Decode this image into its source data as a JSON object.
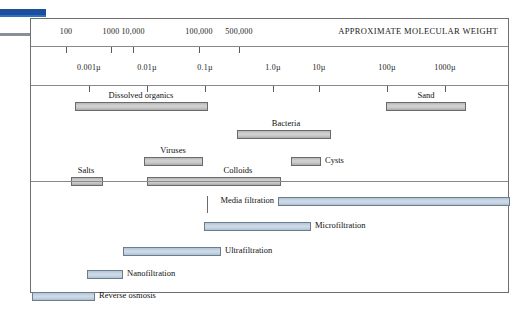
{
  "header": {
    "title": "APPROXIMATE MOLECULAR WEIGHT"
  },
  "chart_data": {
    "type": "bar",
    "title": "APPROXIMATE MOLECULAR WEIGHT",
    "subtitle": "Particle size / filtration spectrum",
    "xlabel": "Particle size (micrometers) / Approximate molecular weight",
    "ylabel": "",
    "grid": false,
    "legend": "none",
    "axes": [
      {
        "name": "molecular_weight",
        "position": "top",
        "ticks": [
          {
            "label": "100",
            "x": 65
          },
          {
            "label": "1000",
            "x": 110
          },
          {
            "label": "10,000",
            "x": 132
          },
          {
            "label": "100,000",
            "x": 198
          },
          {
            "label": "500,000",
            "x": 238
          }
        ]
      },
      {
        "name": "particle_size_microns",
        "position": "top",
        "ticks": [
          {
            "label": "0.001µ",
            "x": 88
          },
          {
            "label": "0.01µ",
            "x": 146
          },
          {
            "label": "0.1µ",
            "x": 204
          },
          {
            "label": "1.0µ",
            "x": 272
          },
          {
            "label": "10µ",
            "x": 318
          },
          {
            "label": "100µ",
            "x": 386
          },
          {
            "label": "1000µ",
            "x": 444
          }
        ]
      }
    ],
    "series": [
      {
        "name": "Particles and constituents",
        "color": "#c8c8c8",
        "bars": [
          {
            "label": "Dissolved organics",
            "x0": 74,
            "x1": 207,
            "row": 0,
            "label_x": 140,
            "label_pos": "above-center"
          },
          {
            "label": "Sand",
            "x0": 385,
            "x1": 465,
            "row": 0,
            "label_x": 425,
            "label_pos": "above-center"
          },
          {
            "label": "Bacteria",
            "x0": 236,
            "x1": 330,
            "row": 1,
            "label_x": 285,
            "label_pos": "above-center"
          },
          {
            "label": "Viruses",
            "x0": 143,
            "x1": 202,
            "row": 2,
            "label_x": 172,
            "label_pos": "above-center"
          },
          {
            "label": "Cysts",
            "x0": 290,
            "x1": 320,
            "row": 2,
            "label_x": 324,
            "label_pos": "right"
          },
          {
            "label": "Colloids",
            "x0": 146,
            "x1": 280,
            "row": 3,
            "label_x": 237,
            "label_pos": "above-center"
          },
          {
            "label": "Salts",
            "x0": 70,
            "x1": 102,
            "row": 3,
            "label_x": 85,
            "label_pos": "above-center"
          }
        ]
      },
      {
        "name": "Filtration processes",
        "color": "#c5d3e0",
        "bars": [
          {
            "label": "Media filtration",
            "x0": 277,
            "x1": 509,
            "row": 0,
            "label_x": 273,
            "label_pos": "left",
            "connector": true
          },
          {
            "label": "Microfiltration",
            "x0": 203,
            "x1": 310,
            "row": 1,
            "label_x": 314,
            "label_pos": "right"
          },
          {
            "label": "Ultrafiltration",
            "x0": 122,
            "x1": 220,
            "row": 2,
            "label_x": 224,
            "label_pos": "right"
          },
          {
            "label": "Nanofiltration",
            "x0": 86,
            "x1": 122,
            "row": 3,
            "label_x": 126,
            "label_pos": "right"
          },
          {
            "label": "Reverse osmosis",
            "x0": 31,
            "x1": 94,
            "row": 4,
            "label_x": 98,
            "label_pos": "right"
          }
        ]
      }
    ]
  },
  "colors": {
    "particle_bar": "#c8c8c8",
    "filtration_bar": "#c5d3e0",
    "bar_border": "#6a6a6a",
    "frame": "#6f6f6f",
    "text": "#1a1a1a",
    "edge_blue": "#1b4f9c",
    "edge_gray": "#8a9098"
  }
}
